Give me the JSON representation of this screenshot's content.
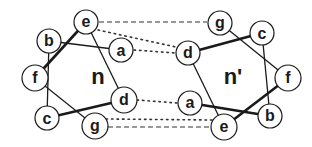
{
  "diagram": {
    "type": "helical-wheel-interaction",
    "colors": {
      "stroke": "#1a1a1a",
      "background": "#ffffff"
    },
    "left_wheel": {
      "label": "n",
      "nodes": [
        {
          "id": "e",
          "label": "e",
          "x": 86,
          "y": 22
        },
        {
          "id": "b",
          "label": "b",
          "x": 49,
          "y": 41
        },
        {
          "id": "a",
          "label": "a",
          "x": 121,
          "y": 50
        },
        {
          "id": "f",
          "label": "f",
          "x": 35,
          "y": 78
        },
        {
          "id": "d",
          "label": "d",
          "x": 124,
          "y": 100
        },
        {
          "id": "c",
          "label": "c",
          "x": 47,
          "y": 118
        },
        {
          "id": "g",
          "label": "g",
          "x": 95,
          "y": 126
        }
      ],
      "label_pos": {
        "x": 98,
        "y": 76
      }
    },
    "right_wheel": {
      "label": "n'",
      "nodes": [
        {
          "id": "g",
          "label": "g",
          "x": 220,
          "y": 23
        },
        {
          "id": "c",
          "label": "c",
          "x": 262,
          "y": 33
        },
        {
          "id": "d",
          "label": "d",
          "x": 188,
          "y": 53
        },
        {
          "id": "f",
          "label": "f",
          "x": 288,
          "y": 78
        },
        {
          "id": "a",
          "label": "a",
          "x": 190,
          "y": 103
        },
        {
          "id": "b",
          "label": "b",
          "x": 270,
          "y": 116
        },
        {
          "id": "e",
          "label": "e",
          "x": 224,
          "y": 127
        }
      ],
      "label_pos": {
        "x": 233,
        "y": 76
      }
    },
    "interactions": [
      {
        "from": "n.e",
        "to": "n'.g",
        "style": "dashed"
      },
      {
        "from": "n.g",
        "to": "n'.e",
        "style": "dashed"
      },
      {
        "from": "n.e",
        "to": "n'.d",
        "style": "dotted"
      },
      {
        "from": "n.a",
        "to": "n'.d",
        "style": "dotted"
      },
      {
        "from": "n.d",
        "to": "n'.a",
        "style": "dotted"
      },
      {
        "from": "n.g",
        "to": "n'.a",
        "style": "dotted"
      }
    ]
  }
}
